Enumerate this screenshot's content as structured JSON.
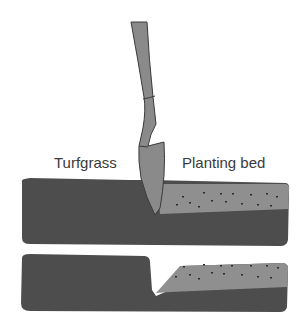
{
  "diagram": {
    "labels": {
      "turfgrass": "Turfgrass",
      "planting_bed": "Planting bed"
    },
    "panels": [
      {
        "name": "cutting",
        "description": "Spade cutting vertically at the boundary between turfgrass and planting bed"
      },
      {
        "name": "result",
        "description": "Finished edge with a V-shaped trench between turf and sloped bed"
      }
    ],
    "colors": {
      "soil_dark": "#4d4d4d",
      "bed_light": "#8f8f8f",
      "spade": "#8a8a8a",
      "spade_outline": "#3a3a3a",
      "mulch_specks": "#2a2a2a"
    }
  }
}
